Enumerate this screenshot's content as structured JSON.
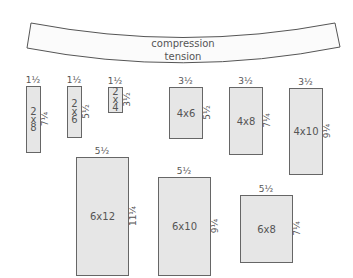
{
  "beam": {
    "top_label": "compression",
    "bottom_label": "tension"
  },
  "lumber": [
    {
      "name": "2x8",
      "label_lines": [
        "2",
        "x",
        "8"
      ],
      "width": "1½",
      "height": "7¼",
      "x": 26,
      "y": 86,
      "w": 14,
      "h": 66
    },
    {
      "name": "2x6",
      "label_lines": [
        "2",
        "x",
        "6"
      ],
      "width": "1½",
      "height": "5½",
      "x": 67,
      "y": 86,
      "w": 14,
      "h": 51
    },
    {
      "name": "2x4",
      "label_lines": [
        "2",
        "x",
        "4"
      ],
      "width": "1½",
      "height": "3½",
      "x": 108,
      "y": 87,
      "w": 14,
      "h": 25
    },
    {
      "name": "4x6",
      "label": "4x6",
      "width": "3½",
      "height": "5½",
      "x": 169,
      "y": 87,
      "w": 33,
      "h": 51
    },
    {
      "name": "4x8",
      "label": "4x8",
      "width": "3½",
      "height": "7¼",
      "x": 229,
      "y": 87,
      "w": 33,
      "h": 67
    },
    {
      "name": "4x10",
      "label": "4x10",
      "width": "3½",
      "height": "9¼",
      "x": 289,
      "y": 88,
      "w": 33,
      "h": 86
    },
    {
      "name": "6x12",
      "label": "6x12",
      "width": "5½",
      "height": "11¼",
      "x": 76,
      "y": 157,
      "w": 52,
      "h": 118
    },
    {
      "name": "6x10",
      "label": "6x10",
      "width": "5½",
      "height": "9¼",
      "x": 158,
      "y": 177,
      "w": 52,
      "h": 98
    },
    {
      "name": "6x8",
      "label": "6x8",
      "width": "5½",
      "height": "7¼",
      "x": 240,
      "y": 195,
      "w": 52,
      "h": 67
    }
  ],
  "colors": {
    "fill": "#e6e6e6",
    "stroke": "#666666",
    "text": "#555555"
  }
}
